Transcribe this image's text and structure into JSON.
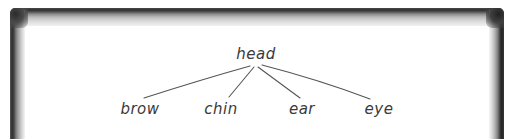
{
  "diagram": {
    "type": "tree",
    "root": {
      "label": "head",
      "x": 256,
      "y": 47
    },
    "children": [
      {
        "label": "brow",
        "x": 140,
        "y": 102
      },
      {
        "label": "chin",
        "x": 221,
        "y": 102
      },
      {
        "label": "ear",
        "x": 302,
        "y": 102
      },
      {
        "label": "eye",
        "x": 379,
        "y": 102
      }
    ],
    "edges": [
      {
        "from": "head",
        "to": "brow",
        "path": "M250,66 Q200,80 144,98"
      },
      {
        "from": "head",
        "to": "chin",
        "path": "M254,67 L229,97"
      },
      {
        "from": "head",
        "to": "ear",
        "path": "M258,67 L300,98"
      },
      {
        "from": "head",
        "to": "eye",
        "path": "M262,65 Q320,80 370,99"
      }
    ]
  },
  "colors": {
    "ink": "#3a3a3a",
    "edge": "#555555",
    "board": "#ffffff",
    "frame_dark": "#2f2f2f"
  }
}
